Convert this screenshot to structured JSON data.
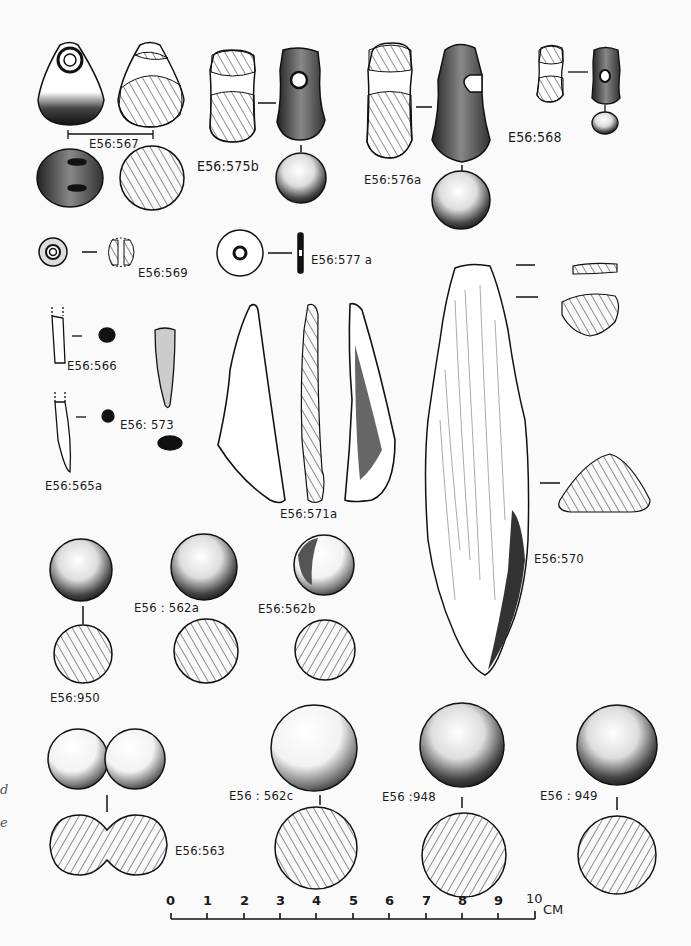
{
  "plate": {
    "type": "archaeological artifact illustration plate",
    "artifacts": [
      {
        "id": "E56:567",
        "label": "E56:567",
        "views": [
          "perforated pendant front",
          "section",
          "base view",
          "base section"
        ]
      },
      {
        "id": "E56:575b",
        "label": "E56:575b",
        "views": [
          "section",
          "perforated pendant",
          "base"
        ]
      },
      {
        "id": "E56:576a",
        "label": "E56:576a",
        "views": [
          "section",
          "perforated pendant",
          "base"
        ]
      },
      {
        "id": "E56:568",
        "label": "E56:568",
        "views": [
          "section",
          "perforated pendant",
          "base"
        ]
      },
      {
        "id": "E56:569",
        "label": "E56:569",
        "views": [
          "bead face",
          "bead section"
        ]
      },
      {
        "id": "E56:577a",
        "label": "E56:577 a",
        "views": [
          "disc bead face",
          "edge section"
        ]
      },
      {
        "id": "E56:566",
        "label": "E56:566",
        "views": [
          "point fragment",
          "section"
        ]
      },
      {
        "id": "E56:573",
        "label": "E56: 573",
        "views": [
          "point",
          "section"
        ]
      },
      {
        "id": "E56:565a",
        "label": "E56:565a",
        "views": [
          "point fragment",
          "section"
        ]
      },
      {
        "id": "E56:571a",
        "label": "E56:571a",
        "views": [
          "face",
          "section",
          "reverse face"
        ]
      },
      {
        "id": "E56:570",
        "label": "E56:570",
        "views": [
          "bone tool face",
          "three sections"
        ]
      },
      {
        "id": "E56:950",
        "label": "E56:950",
        "views": [
          "ball",
          "section"
        ]
      },
      {
        "id": "E56:562a",
        "label": "E56 : 562a",
        "views": [
          "ball",
          "section"
        ]
      },
      {
        "id": "E56:562b",
        "label": "E56:562b",
        "views": [
          "ball",
          "section"
        ]
      },
      {
        "id": "E56:563",
        "label": "E56:563",
        "views": [
          "double ball",
          "section"
        ]
      },
      {
        "id": "E56:562c",
        "label": "E56 : 562c",
        "views": [
          "ball",
          "section"
        ]
      },
      {
        "id": "E56:948",
        "label": "E56 :948",
        "views": [
          "ball",
          "section"
        ]
      },
      {
        "id": "E56:949",
        "label": "E56 : 949",
        "views": [
          "ball",
          "section"
        ]
      }
    ]
  },
  "scale_bar": {
    "ticks": [
      "0",
      "1",
      "2",
      "3",
      "4",
      "5",
      "6",
      "7",
      "8",
      "9",
      "10"
    ],
    "unit": "CM"
  },
  "margin_fragments": [
    "d",
    "e"
  ]
}
